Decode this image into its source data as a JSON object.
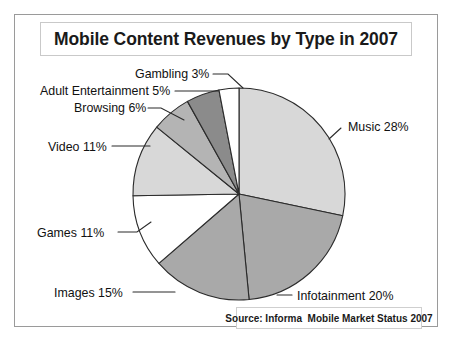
{
  "figure": {
    "title": "Mobile Content Revenues by Type in 2007",
    "source": "Source: Informa  Mobile Market Status 2007",
    "background_color": "#ffffff",
    "frame_color": "#9a9a9a"
  },
  "chart_data": {
    "type": "pie",
    "title": "Mobile Content Revenues by Type in 2007",
    "subtitle": "",
    "xlabel": "",
    "ylabel": "",
    "units": "percent",
    "total": 99,
    "start_angle_deg": 0,
    "direction": "clockwise",
    "legend": "none",
    "grid": false,
    "annotation": "Source: Informa  Mobile Market Status 2007",
    "categories": [
      "Music",
      "Infotainment",
      "Images",
      "Games",
      "Video",
      "Browsing",
      "Adult Entertainment",
      "Gambling"
    ],
    "values": [
      28,
      20,
      15,
      11,
      11,
      6,
      5,
      3
    ],
    "colors": [
      "#d8d8d8",
      "#a9a9a9",
      "#a9a9a9",
      "#ffffff",
      "#d8d8d8",
      "#b4b4b4",
      "#8b8b8b",
      "#ffffff"
    ],
    "slices": [
      {
        "name": "Music",
        "value": 28,
        "label": "Music 28%",
        "color": "#d8d8d8",
        "label_x": 348,
        "label_y": 131,
        "anchor": "start",
        "leader": "M 329 139 L 341 128"
      },
      {
        "name": "Infotainment",
        "value": 20,
        "label": "Infotainment 20%",
        "color": "#a9a9a9",
        "label_x": 297,
        "label_y": 300,
        "anchor": "start",
        "leader": "M 277 295 L 292 295"
      },
      {
        "name": "Images",
        "value": 15,
        "label": "Images 15%",
        "color": "#a9a9a9",
        "label_x": 54,
        "label_y": 297,
        "anchor": "start",
        "leader": "M 133 292 L 175 292"
      },
      {
        "name": "Games",
        "value": 11,
        "label": "Games 11%",
        "color": "#ffffff",
        "label_x": 37,
        "label_y": 237,
        "anchor": "start",
        "leader": "M 118 232 L 137 232 L 151 222"
      },
      {
        "name": "Video",
        "value": 11,
        "label": "Video 11%",
        "color": "#d8d8d8",
        "label_x": 48,
        "label_y": 151,
        "anchor": "start",
        "leader": "M 112 146 L 150 146"
      },
      {
        "name": "Browsing",
        "value": 6,
        "label": "Browsing 6%",
        "color": "#b4b4b4",
        "label_x": 74,
        "label_y": 112,
        "anchor": "start",
        "leader": "M 148 108 L 161 108 L 184 120"
      },
      {
        "name": "Adult Entertainment",
        "value": 5,
        "label": "Adult Entertainment 5%",
        "color": "#8b8b8b",
        "label_x": 40,
        "label_y": 95,
        "anchor": "start",
        "leader": "M 175 91 L 218 91"
      },
      {
        "name": "Gambling",
        "value": 3,
        "label": "Gambling 3%",
        "color": "#ffffff",
        "label_x": 135,
        "label_y": 78,
        "anchor": "start",
        "leader": "M 213 74 L 228 74 L 243 88"
      }
    ],
    "geometry": {
      "center_x": 239,
      "center_y": 194,
      "radius": 106
    }
  }
}
